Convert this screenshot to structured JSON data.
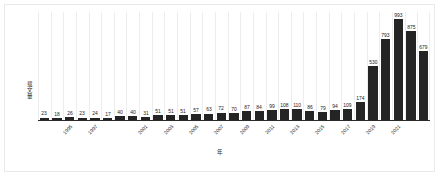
{
  "chart_data": {
    "type": "bar",
    "title": "",
    "subtitle": "",
    "xlabel": "年",
    "ylabel": "载文量",
    "categories": [
      "1993",
      "1994",
      "1995",
      "1996",
      "1997",
      "1998",
      "1999",
      "2000",
      "2001",
      "2002",
      "2003",
      "2004",
      "2005",
      "2006",
      "2007",
      "2008",
      "2009",
      "2010",
      "2011",
      "2012",
      "2013",
      "2014",
      "2015",
      "2016",
      "2017",
      "2018",
      "2019",
      "2020",
      "2021",
      "2022",
      "2023"
    ],
    "values": [
      23,
      18,
      26,
      23,
      24,
      17,
      40,
      40,
      31,
      51,
      51,
      51,
      57,
      63,
      72,
      70,
      87,
      84,
      99,
      108,
      110,
      86,
      79,
      94,
      109,
      174,
      530,
      793,
      993,
      875,
      679
    ],
    "tick_labels": [
      "",
      "",
      "1995",
      "",
      "1997",
      "",
      "",
      "",
      "2001",
      "",
      "2003",
      "",
      "2005",
      "",
      "2007",
      "",
      "2009",
      "",
      "2011",
      "",
      "2013",
      "",
      "2015",
      "",
      "2017",
      "",
      "2019",
      "",
      "2021",
      "",
      ""
    ],
    "ylim": [
      0,
      1060
    ],
    "grid": "vertical-category-separators",
    "legend": "none",
    "bar_color": "#242424",
    "gridline_color": "#ededed",
    "axis_color": "#2a2a2a",
    "frame_color": "#e9e9e9",
    "background": "#ffffff",
    "data_labels_shown": true
  }
}
